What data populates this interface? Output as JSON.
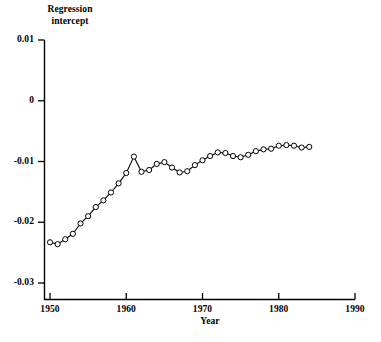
{
  "chart_data": {
    "type": "line",
    "title": "",
    "xlabel": "Year",
    "ylabel": "Regression intercept",
    "ylabel_line1": "Regression",
    "ylabel_line2": "intercept",
    "xlim": [
      1950,
      1990
    ],
    "ylim": [
      -0.03,
      0.01
    ],
    "xticks": [
      1950,
      1960,
      1970,
      1980,
      1990
    ],
    "xtick_labels": [
      "1950",
      "1960",
      "1970",
      "1980",
      "1990"
    ],
    "yticks": [
      0.01,
      0,
      -0.01,
      -0.02,
      -0.03
    ],
    "ytick_labels": [
      "0.01",
      "0",
      "-0.01",
      "-0.02",
      "-0.03"
    ],
    "grid": false,
    "legend": false,
    "marker": "open-circle",
    "line_color": "#000000",
    "marker_fill": "#ffffff",
    "marker_edge": "#000000",
    "x": [
      1950,
      1951,
      1952,
      1953,
      1954,
      1955,
      1956,
      1957,
      1958,
      1959,
      1960,
      1961,
      1962,
      1963,
      1964,
      1965,
      1966,
      1967,
      1968,
      1969,
      1970,
      1971,
      1972,
      1973,
      1974,
      1975,
      1976,
      1977,
      1978,
      1979,
      1980,
      1981,
      1982,
      1983,
      1984
    ],
    "values": [
      -0.0233,
      -0.0236,
      -0.0228,
      -0.0219,
      -0.0202,
      -0.019,
      -0.0175,
      -0.0164,
      -0.0151,
      -0.0136,
      -0.0119,
      -0.0092,
      -0.0117,
      -0.0114,
      -0.0104,
      -0.0101,
      -0.011,
      -0.0118,
      -0.0116,
      -0.0106,
      -0.0098,
      -0.0091,
      -0.0085,
      -0.0086,
      -0.0091,
      -0.0093,
      -0.0089,
      -0.0083,
      -0.008,
      -0.0079,
      -0.0074,
      -0.0073,
      -0.0074,
      -0.0077,
      -0.0076
    ]
  },
  "axis": {
    "y_axis_name": "y-axis-line",
    "x_axis_name": "x-axis-line"
  }
}
